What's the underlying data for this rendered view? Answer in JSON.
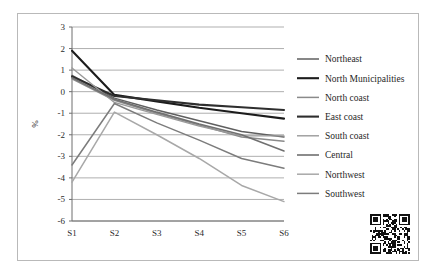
{
  "figure": {
    "background_color": "#ffffff",
    "frame_color": "#b9b9b9",
    "gridline_color": "#8d8d8d",
    "axis_color": "#6f6f6f"
  },
  "watermark": {
    "name": "qr-code-watermark",
    "alt_text": "QR code"
  },
  "chart_data": {
    "type": "line",
    "title": "",
    "subtitle": "",
    "xlabel": "",
    "ylabel": "%",
    "categories": [
      "S1",
      "S2",
      "S3",
      "S4",
      "S5",
      "S6"
    ],
    "ylim": [
      -6,
      3
    ],
    "yticks": [
      3,
      2,
      1,
      0,
      -1,
      -2,
      -3,
      -4,
      -5,
      -6
    ],
    "ytick_labels": [
      "3",
      "2",
      "1",
      "0",
      "-1",
      "-2",
      "-3",
      "-4",
      "-5",
      "-6"
    ],
    "grid": true,
    "grid_axis": "y",
    "legend_position": "right",
    "series": [
      {
        "name": "Northeast",
        "color": "#5f5f5f",
        "width": 1.5,
        "values": [
          0.75,
          -0.3,
          -0.85,
          -1.35,
          -1.85,
          -2.1
        ]
      },
      {
        "name": "North Municipalities",
        "color": "#1c1c1c",
        "width": 2.1,
        "values": [
          1.9,
          -0.15,
          -0.45,
          -0.75,
          -1.0,
          -1.25
        ]
      },
      {
        "name": "North coast",
        "color": "#8a8a8a",
        "width": 1.5,
        "values": [
          0.6,
          -0.4,
          -1.0,
          -1.55,
          -2.1,
          -2.3
        ]
      },
      {
        "name": "East coast",
        "color": "#2e2e2e",
        "width": 2.1,
        "values": [
          0.7,
          -0.2,
          -0.4,
          -0.6,
          -0.72,
          -0.85
        ]
      },
      {
        "name": "South coast",
        "color": "#9a9a9a",
        "width": 1.4,
        "values": [
          1.1,
          -0.5,
          -1.05,
          -1.6,
          -2.05,
          -2.05
        ]
      },
      {
        "name": "Central",
        "color": "#707070",
        "width": 1.6,
        "values": [
          0.65,
          -0.35,
          -0.95,
          -1.5,
          -2.0,
          -2.75
        ]
      },
      {
        "name": "Northwest",
        "color": "#a8a8a8",
        "width": 1.5,
        "values": [
          -4.2,
          -0.95,
          -2.0,
          -3.1,
          -4.35,
          -5.1
        ]
      },
      {
        "name": "Southwest",
        "color": "#7c7c7c",
        "width": 1.5,
        "values": [
          -3.4,
          -0.55,
          -1.45,
          -2.25,
          -3.1,
          -3.55
        ]
      }
    ]
  }
}
